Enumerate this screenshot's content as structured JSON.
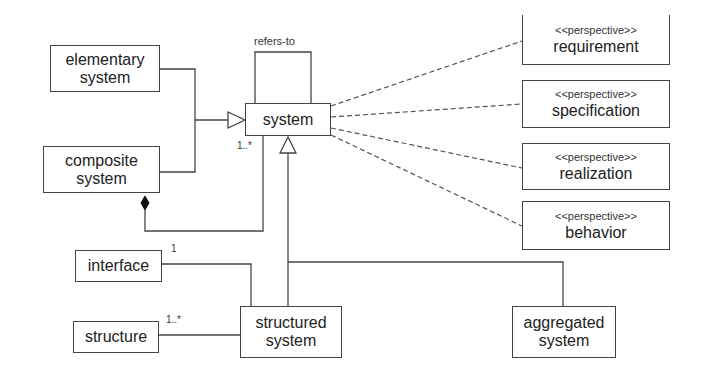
{
  "diagram": {
    "type": "UML class diagram",
    "classes": {
      "elementary_system": {
        "line1": "elementary",
        "line2": "system"
      },
      "composite_system": {
        "line1": "composite",
        "line2": "system"
      },
      "system": {
        "name": "system"
      },
      "interface": {
        "name": "interface"
      },
      "structure": {
        "name": "structure"
      },
      "structured_system": {
        "line1": "structured",
        "line2": "system"
      },
      "aggregated_system": {
        "line1": "aggregated",
        "line2": "system"
      }
    },
    "perspectives": [
      {
        "stereotype": "<<perspective>>",
        "name": "requirement"
      },
      {
        "stereotype": "<<perspective>>",
        "name": "specification"
      },
      {
        "stereotype": "<<perspective>>",
        "name": "realization"
      },
      {
        "stereotype": "<<perspective>>",
        "name": "behavior"
      }
    ],
    "labels": {
      "self_association": "refers-to",
      "composition_multiplicity": "1..*",
      "interface_multiplicity": "1",
      "structure_multiplicity": "1..*"
    },
    "relationships": [
      {
        "from": "elementary system",
        "to": "system",
        "kind": "generalization"
      },
      {
        "from": "composite system",
        "to": "system",
        "kind": "generalization"
      },
      {
        "from": "composite system",
        "to": "system",
        "kind": "composition",
        "multiplicity": "1..*"
      },
      {
        "from": "system",
        "to": "system",
        "kind": "association",
        "label": "refers-to"
      },
      {
        "from": "structured system",
        "to": "system",
        "kind": "generalization"
      },
      {
        "from": "aggregated system",
        "to": "system",
        "kind": "generalization"
      },
      {
        "from": "structured system",
        "to": "interface",
        "kind": "association",
        "multiplicity": "1"
      },
      {
        "from": "structured system",
        "to": "structure",
        "kind": "association",
        "multiplicity": "1..*"
      },
      {
        "from": "system",
        "to": "requirement",
        "kind": "dependency"
      },
      {
        "from": "system",
        "to": "specification",
        "kind": "dependency"
      },
      {
        "from": "system",
        "to": "realization",
        "kind": "dependency"
      },
      {
        "from": "system",
        "to": "behavior",
        "kind": "dependency"
      }
    ]
  }
}
